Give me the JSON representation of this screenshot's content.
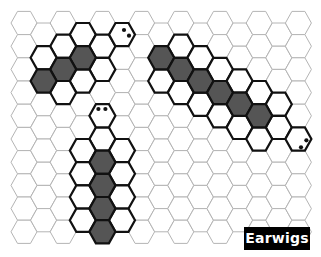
{
  "title": "Earwigs",
  "colors": {
    "grid_line": "#b4b4b4",
    "outline": "#111111",
    "body_fill": "#555555",
    "background": "#ffffff",
    "label_bg": "#000000",
    "label_text": "#ffffff"
  },
  "grid": {
    "columns": 15,
    "rows_even_columns": 10,
    "rows_odd_columns": 9,
    "orientation": "flat-top",
    "origin_x": 24,
    "origin_y": 23,
    "col_spacing": 19.6,
    "row_spacing": 23.2,
    "hex_radius": 13
  },
  "earwigs": [
    {
      "name": "earwig-top-left",
      "head": {
        "col": 5,
        "row": 0,
        "eyes": [
          [
            2,
            -4.6
          ],
          [
            7,
            1.1
          ]
        ]
      },
      "body": [
        {
          "col": 3,
          "row": 1
        },
        {
          "col": 2,
          "row": 2
        },
        {
          "col": 1,
          "row": 2
        }
      ],
      "outline": [
        {
          "col": 3,
          "row": 0
        },
        {
          "col": 4,
          "row": 1
        },
        {
          "col": 4,
          "row": 2
        },
        {
          "col": 2,
          "row": 1
        },
        {
          "col": 1,
          "row": 1
        },
        {
          "col": 3,
          "row": 2
        },
        {
          "col": 2,
          "row": 3
        }
      ]
    },
    {
      "name": "earwig-bottom",
      "head": {
        "col": 4,
        "row": 4,
        "eyes": [
          [
            -4,
            -6.8
          ],
          [
            3,
            -6.8
          ]
        ]
      },
      "body": [
        {
          "col": 4,
          "row": 6
        },
        {
          "col": 4,
          "row": 7
        },
        {
          "col": 4,
          "row": 8
        },
        {
          "col": 4,
          "row": 9
        }
      ],
      "outline": [
        {
          "col": 4,
          "row": 5
        },
        {
          "col": 3,
          "row": 5
        },
        {
          "col": 3,
          "row": 6
        },
        {
          "col": 3,
          "row": 7
        },
        {
          "col": 3,
          "row": 8
        },
        {
          "col": 5,
          "row": 5
        },
        {
          "col": 5,
          "row": 6
        },
        {
          "col": 5,
          "row": 7
        },
        {
          "col": 5,
          "row": 8
        }
      ]
    },
    {
      "name": "earwig-right",
      "head": {
        "col": 14,
        "row": 5,
        "eyes": [
          [
            8,
            1.3
          ],
          [
            2.6,
            8.3
          ]
        ]
      },
      "body": [
        {
          "col": 7,
          "row": 1
        },
        {
          "col": 8,
          "row": 2
        },
        {
          "col": 9,
          "row": 2
        },
        {
          "col": 10,
          "row": 3
        },
        {
          "col": 11,
          "row": 3
        },
        {
          "col": 12,
          "row": 4
        }
      ],
      "outline": [
        {
          "col": 8,
          "row": 1
        },
        {
          "col": 9,
          "row": 1
        },
        {
          "col": 10,
          "row": 2
        },
        {
          "col": 11,
          "row": 2
        },
        {
          "col": 12,
          "row": 3
        },
        {
          "col": 13,
          "row": 3
        },
        {
          "col": 13,
          "row": 4
        },
        {
          "col": 7,
          "row": 2
        },
        {
          "col": 8,
          "row": 3
        },
        {
          "col": 9,
          "row": 3
        },
        {
          "col": 10,
          "row": 4
        },
        {
          "col": 11,
          "row": 4
        },
        {
          "col": 12,
          "row": 5
        }
      ]
    }
  ]
}
